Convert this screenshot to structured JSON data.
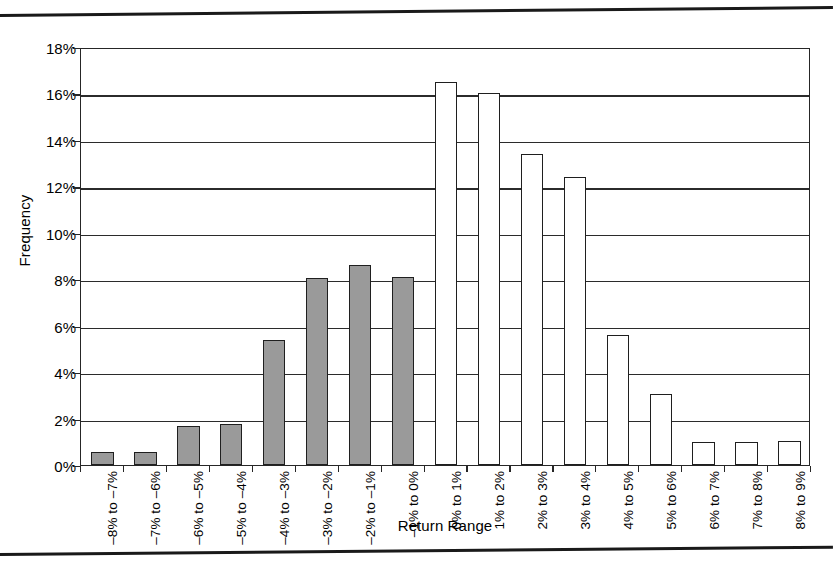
{
  "chart_data": {
    "type": "bar",
    "title": "",
    "xlabel": "Return Range",
    "ylabel": "Frequency",
    "ylim": [
      0,
      18
    ],
    "ytick_labels": [
      "0%",
      "2%",
      "4%",
      "6%",
      "8%",
      "10%",
      "12%",
      "14%",
      "16%",
      "18%"
    ],
    "ytick_values": [
      0,
      2,
      4,
      6,
      8,
      10,
      12,
      14,
      16,
      18
    ],
    "grid": true,
    "legend": "none",
    "categories": [
      "–8% to –7%",
      "–7% to –6%",
      "–6% to –5%",
      "–5% to –4%",
      "–4% to –3%",
      "–3% to –2%",
      "–2% to –1%",
      "–1% to 0%",
      "0% to 1%",
      "1% to 2%",
      "2% to 3%",
      "3% to 4%",
      "4% to 5%",
      "5% to 6%",
      "6% to 7%",
      "7% to 8%",
      "8% to 9%"
    ],
    "values": [
      0.55,
      0.55,
      1.7,
      1.75,
      5.4,
      8.05,
      8.6,
      8.1,
      16.5,
      16.0,
      13.4,
      12.4,
      5.6,
      3.05,
      1.0,
      1.0,
      1.05
    ],
    "bar_styles": [
      "negative",
      "negative",
      "negative",
      "negative",
      "negative",
      "negative",
      "negative",
      "negative",
      "positive",
      "positive",
      "positive",
      "positive",
      "positive",
      "positive",
      "positive",
      "positive",
      "positive"
    ],
    "colors": {
      "negative_fill": "#9a9a9a",
      "positive_fill": "#ffffff",
      "bar_outline": "#1f1f1f",
      "gridline": "#2b2b2b",
      "axis": "#262626",
      "background": "#ffffff"
    }
  }
}
